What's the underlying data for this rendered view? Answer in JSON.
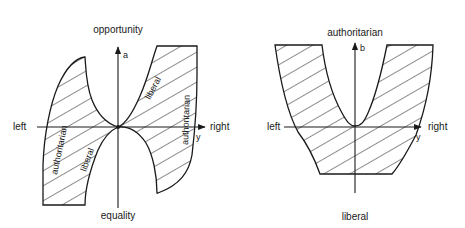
{
  "figure_left": {
    "axis_top_label": "opportunity",
    "axis_bottom_label": "equality",
    "axis_left_label": "left",
    "axis_right_label": "right",
    "vertical_axis_symbol": "a",
    "horizontal_axis_symbol": "y",
    "region_labels": {
      "upper_right_inner": "liberal",
      "upper_right_outer": "authoritarian",
      "lower_left_outer": "authoritarian",
      "lower_left_inner": "liberal"
    }
  },
  "figure_right": {
    "axis_top_label": "authoritarian",
    "axis_bottom_label": "liberal",
    "axis_left_label": "left",
    "axis_right_label": "right",
    "vertical_axis_symbol": "b",
    "horizontal_axis_symbol": "y"
  },
  "colors": {
    "ink": "#1a1a1a",
    "background": "#ffffff"
  }
}
